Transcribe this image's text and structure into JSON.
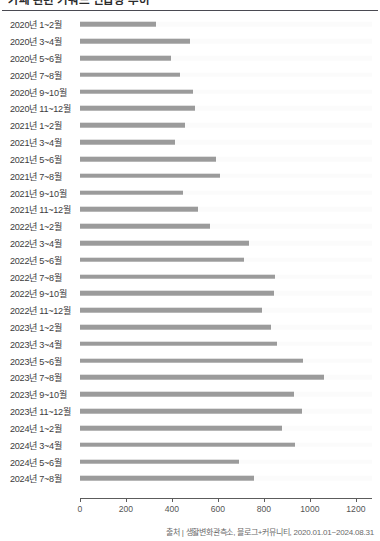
{
  "header": {
    "title": "카페 관련 키워드 언급량 추이",
    "divider": true
  },
  "source_note": "출처 | 생활변화관측소, 블로그+커뮤니티, 2020.01.01~2024.08.31",
  "axis": {
    "ticks": [
      "0",
      "200",
      "400",
      "600",
      "800",
      "1000",
      "1200"
    ]
  },
  "colors": {
    "bar": "#9b9b9b",
    "track": "#fbfbfb",
    "axis": "#5c5c5c",
    "rule": "#4a4a52",
    "label": "#3c3c3c"
  },
  "chart_data": {
    "type": "bar",
    "orientation": "horizontal",
    "title": "카페 관련 키워드 언급량 추이",
    "xlabel": "",
    "ylabel": "",
    "xlim": [
      0,
      1270
    ],
    "grid": false,
    "legend": null,
    "xticks": [
      0,
      200,
      400,
      600,
      800,
      1000,
      1200
    ],
    "categories": [
      "2020년 1~2월",
      "2020년 3~4월",
      "2020년 5~6월",
      "2020년 7~8월",
      "2020년 9~10월",
      "2020년 11~12월",
      "2021년 1~2월",
      "2021년 3~4월",
      "2021년 5~6월",
      "2021년 7~8월",
      "2021년 9~10월",
      "2021년 11~12월",
      "2022년 1~2월",
      "2022년 3~4월",
      "2022년 5~6월",
      "2022년 7~8월",
      "2022년 9~10월",
      "2022년 11~12월",
      "2023년 1~2월",
      "2023년 3~4월",
      "2023년 5~6월",
      "2023년 7~8월",
      "2023년 9~10월",
      "2023년 11~12월",
      "2024년 1~2월",
      "2024년 3~4월",
      "2024년 5~6월",
      "2024년 7~8월"
    ],
    "values": [
      330,
      480,
      395,
      435,
      490,
      500,
      455,
      415,
      590,
      610,
      450,
      515,
      565,
      735,
      715,
      850,
      845,
      790,
      830,
      855,
      970,
      1060,
      930,
      965,
      880,
      935,
      690,
      755
    ],
    "source": "출처 | 생활변화관측소, 블로그+커뮤니티, 2020.01.01~2024.08.31"
  }
}
